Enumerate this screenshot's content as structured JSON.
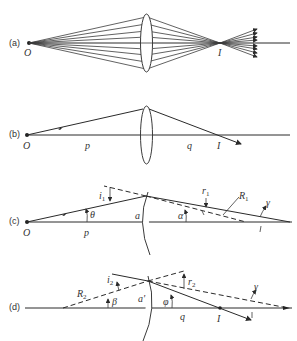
{
  "diagram": {
    "panels": [
      {
        "id": "a",
        "label": "(a)",
        "points": {
          "object": "O",
          "image": "I"
        }
      },
      {
        "id": "b",
        "label": "(b)",
        "points": {
          "object": "O",
          "image": "I"
        },
        "distances": {
          "object": "p",
          "image": "q"
        }
      },
      {
        "id": "c",
        "label": "(c)",
        "points": {
          "object": "O"
        },
        "distances": {
          "object": "p",
          "height": "a"
        },
        "angles": {
          "theta": "θ",
          "alpha": "α",
          "gamma": "γ",
          "incidence": "i",
          "incidence_sub": "1",
          "refraction": "r",
          "refraction_sub": "1"
        },
        "radius": {
          "name": "R",
          "sub": "1"
        }
      },
      {
        "id": "d",
        "label": "(d)",
        "points": {
          "image": "I"
        },
        "distances": {
          "image": "q",
          "height": "a'"
        },
        "angles": {
          "beta": "β",
          "phi": "φ",
          "gamma": "γ",
          "incidence": "i",
          "incidence_sub": "2",
          "refraction": "r",
          "refraction_sub": "2"
        },
        "radius": {
          "name": "R",
          "sub": "2"
        }
      }
    ],
    "colors": {
      "line": "#2a2a2a",
      "text": "#333333",
      "background": "#ffffff"
    }
  }
}
